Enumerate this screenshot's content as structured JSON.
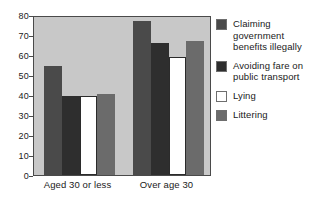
{
  "chart_data": {
    "type": "bar",
    "title": "",
    "subtitle": "",
    "xlabel": "",
    "ylabel": "",
    "categories": [
      "Aged 30 or less",
      "Over age 30"
    ],
    "ylim": [
      0,
      80
    ],
    "yticks": [
      0,
      10,
      20,
      30,
      40,
      50,
      60,
      70,
      80
    ],
    "ytick_labels": [
      "0",
      "10",
      "20",
      "30",
      "40",
      "50",
      "60",
      "70",
      "80"
    ],
    "grid": false,
    "legend_position": "right",
    "annotations": [],
    "series": [
      {
        "name": "Claiming government benefits illegally",
        "color": "#4a4a4a",
        "values": [
          55,
          78
        ]
      },
      {
        "name": "Avoiding fare on public transport",
        "color": "#2e2e2e",
        "values": [
          40,
          67
        ]
      },
      {
        "name": "Lying",
        "color": "#ffffff",
        "values": [
          40,
          60
        ]
      },
      {
        "name": "Littering",
        "color": "#6b6b6b",
        "values": [
          41,
          68
        ]
      }
    ]
  },
  "legend": {
    "items": [
      {
        "label": "Claiming government benefits illegally",
        "color": "#4a4a4a"
      },
      {
        "label": "Avoiding fare on public transport",
        "color": "#2e2e2e"
      },
      {
        "label": "Lying",
        "color": "#ffffff"
      },
      {
        "label": "Littering",
        "color": "#6b6b6b"
      }
    ]
  },
  "plot": {
    "background_color": "#c8c8c8",
    "border_color": "#4a4a4a"
  }
}
